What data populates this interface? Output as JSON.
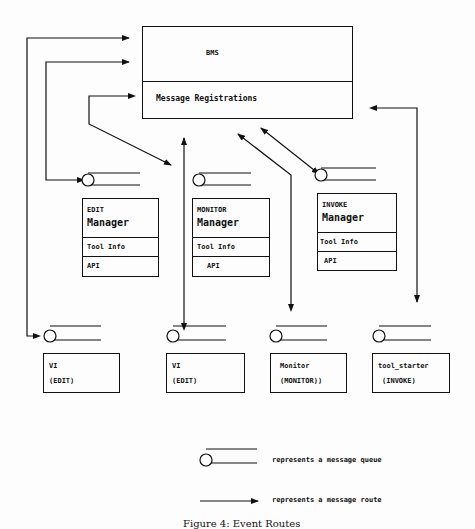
{
  "bms": {
    "title": "BMS",
    "section": "Message Registrations"
  },
  "managers": [
    {
      "tool": "EDIT",
      "label": "Manager",
      "tool_info": "Tool Info",
      "api": "API"
    },
    {
      "tool": "MONITOR",
      "label": "Manager",
      "tool_info": "Tool Info",
      "api": "API"
    },
    {
      "tool": "INVOKE",
      "label": "Manager",
      "tool_info": "Tool Info",
      "api": "API"
    }
  ],
  "tools": [
    {
      "name": "VI",
      "type": "(EDIT)"
    },
    {
      "name": "VI",
      "type": "(EDIT)"
    },
    {
      "name": "Monitor",
      "type": "(MONITOR))"
    },
    {
      "name": "tool_starter",
      "type": "(INVOKE)"
    }
  ],
  "legend": {
    "queue": "represents a message queue",
    "route": "represents a message route"
  },
  "caption": "Figure 4: Event Routes",
  "colors": {
    "line": "#111111",
    "background": "#fdfdfd"
  }
}
